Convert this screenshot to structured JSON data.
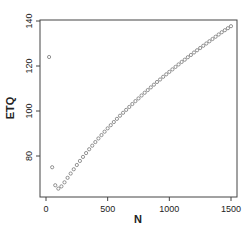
{
  "chart_data": {
    "type": "scatter",
    "title": "",
    "xlabel": "N",
    "ylabel": "ETQ",
    "xlim": [
      -40,
      1560
    ],
    "ylim": [
      61,
      140
    ],
    "xticks": [
      0,
      500,
      1000,
      1500
    ],
    "yticks": [
      80,
      100,
      120,
      140
    ],
    "grid": false,
    "legend": null,
    "marker": "open-circle",
    "color": "#777777",
    "series": [
      {
        "name": "ETQ",
        "x": [
          25,
          50,
          75,
          100,
          125,
          150,
          175,
          200,
          225,
          250,
          275,
          300,
          325,
          350,
          375,
          400,
          425,
          450,
          475,
          500,
          525,
          550,
          575,
          600,
          625,
          650,
          675,
          700,
          725,
          750,
          775,
          800,
          825,
          850,
          875,
          900,
          925,
          950,
          975,
          1000,
          1025,
          1050,
          1075,
          1100,
          1125,
          1150,
          1175,
          1200,
          1225,
          1250,
          1275,
          1300,
          1325,
          1350,
          1375,
          1400,
          1425,
          1450,
          1475,
          1500
        ],
        "y": [
          124,
          75,
          67,
          65.5,
          66.5,
          68.3,
          70.3,
          72.2,
          74.1,
          76,
          77.8,
          79.6,
          81.3,
          83,
          84.6,
          86.2,
          87.8,
          89.3,
          90.8,
          92.3,
          93.7,
          95.1,
          96.5,
          97.9,
          99.2,
          100.5,
          101.8,
          103.1,
          104.4,
          105.6,
          106.9,
          108.1,
          109.3,
          110.5,
          111.7,
          112.9,
          114,
          115.2,
          116.3,
          117.4,
          118.5,
          119.6,
          120.7,
          121.8,
          122.8,
          123.9,
          124.9,
          126,
          127,
          128,
          129,
          130,
          131,
          132,
          133,
          134,
          135,
          135.9,
          136.8,
          137.7
        ]
      }
    ]
  },
  "axes": {
    "x_label": "N",
    "y_label": "ETQ",
    "x_tick_labels": [
      "0",
      "500",
      "1000",
      "1500"
    ],
    "y_tick_labels": [
      "80",
      "100",
      "120",
      "140"
    ]
  }
}
